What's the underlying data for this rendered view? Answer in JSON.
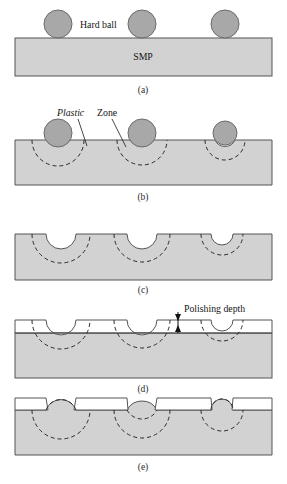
{
  "figure": {
    "title": "",
    "panels": [
      {
        "id": "a",
        "label": "(a)",
        "annotations": [
          {
            "name": "hard-ball-label",
            "text": "Hard ball"
          }
        ]
      },
      {
        "id": "b",
        "label": "(b)",
        "annotations": [
          {
            "name": "plastic-zone-label",
            "text_italic": "Plastic",
            "text_regular": "Zone"
          }
        ]
      },
      {
        "id": "c",
        "label": "(c)",
        "annotations": []
      },
      {
        "id": "d",
        "label": "(d)",
        "annotations": [
          {
            "name": "polishing-depth-label",
            "text": "Polishing depth"
          }
        ]
      },
      {
        "id": "e",
        "label": "(e)",
        "annotations": []
      }
    ],
    "substrate_label": "SMP",
    "colors": {
      "substrate_fill": "#d2d2d2",
      "ball_fill": "#a8a8a8",
      "outline": "#4a4a4a",
      "dashed": "#2a2a2a",
      "polished_layer": "#ffffff",
      "text": "#141414"
    },
    "geometry": {
      "slab_left": 15,
      "slab_right": 272,
      "ball_centers_x": [
        58,
        142,
        225
      ],
      "ball_radius": 14,
      "crater_radii": [
        15,
        15,
        11
      ],
      "plastic_zone_radii": [
        26,
        25,
        20
      ]
    }
  }
}
